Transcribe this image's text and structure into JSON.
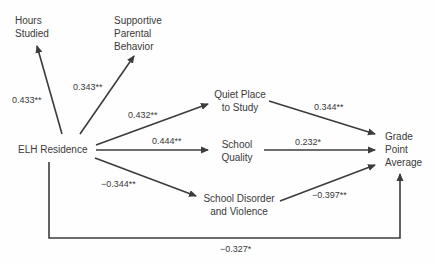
{
  "diagram": {
    "type": "path-diagram",
    "nodes": {
      "elh_residence": {
        "label": "ELH Residence"
      },
      "hours_studied": {
        "lines": [
          "Hours",
          "Studied"
        ]
      },
      "supportive_parental": {
        "lines": [
          "Supportive",
          "Parental",
          "Behavior"
        ]
      },
      "quiet_place": {
        "lines": [
          "Quiet Place",
          "to Study"
        ]
      },
      "school_quality": {
        "lines": [
          "School",
          "Quality"
        ]
      },
      "school_disorder": {
        "lines": [
          "School Disorder",
          "and Violence"
        ]
      },
      "gpa": {
        "lines": [
          "Grade",
          "Point",
          "Average"
        ]
      }
    },
    "edges": [
      {
        "from": "ELH Residence",
        "to": "Hours Studied",
        "coefficient": "0.433**"
      },
      {
        "from": "ELH Residence",
        "to": "Supportive Parental Behavior",
        "coefficient": "0.343**"
      },
      {
        "from": "ELH Residence",
        "to": "Quiet Place to Study",
        "coefficient": "0.432**"
      },
      {
        "from": "ELH Residence",
        "to": "School Quality",
        "coefficient": "0.444**"
      },
      {
        "from": "ELH Residence",
        "to": "School Disorder and Violence",
        "coefficient": "−0.344**"
      },
      {
        "from": "Quiet Place to Study",
        "to": "Grade Point Average",
        "coefficient": "0.344**"
      },
      {
        "from": "School Quality",
        "to": "Grade Point Average",
        "coefficient": "0.232*"
      },
      {
        "from": "School Disorder and Violence",
        "to": "Grade Point Average",
        "coefficient": "−0.397**"
      },
      {
        "from": "ELH Residence",
        "to": "Grade Point Average",
        "coefficient": "−0.327*"
      }
    ],
    "colors": {
      "line": "#3c3c3c",
      "text": "#3a3a3a",
      "background": "#fefefe"
    }
  }
}
